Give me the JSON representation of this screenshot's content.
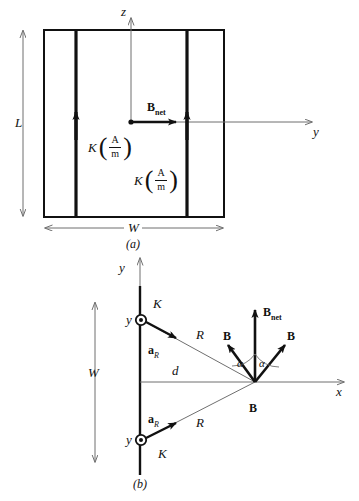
{
  "figure": {
    "title_a": "(a)",
    "title_b": "(b)"
  },
  "panel_a": {
    "axis_z_label": "z",
    "axis_y_label": "y",
    "dimension_height_label": "L",
    "dimension_width_label": "W",
    "bnet_label": "B",
    "bnet_subscript": "net",
    "sheet_current_1": {
      "symbol": "K",
      "unit_numerator": "A",
      "unit_denominator": "m"
    },
    "sheet_current_2": {
      "symbol": "K",
      "unit_numerator": "A",
      "unit_denominator": "m"
    }
  },
  "panel_b": {
    "axis_y_label": "y",
    "axis_x_label": "x",
    "dimension_width_label": "W",
    "distance_label": "d",
    "bnet_label": "B",
    "bnet_subscript": "net",
    "b_left_label": "B",
    "b_right_label": "B",
    "b_bottom_label": "B",
    "angle_left_label": "α",
    "angle_right_label": "α",
    "source_top": {
      "coordinate_label": "y",
      "current_label": "K",
      "unit_vector_label": "a",
      "unit_vector_subscript": "R",
      "radius_label": "R"
    },
    "source_bottom": {
      "coordinate_label": "y",
      "current_label": "K",
      "unit_vector_label": "a",
      "unit_vector_subscript": "R",
      "radius_label": "R"
    }
  },
  "colors": {
    "ink": "#111111",
    "thin_line": "#6f6f6f",
    "background": "#ffffff"
  }
}
